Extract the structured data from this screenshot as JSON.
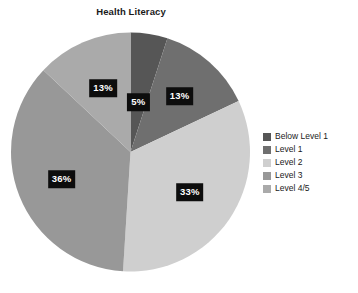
{
  "chart_data": {
    "type": "pie",
    "title": "Health Literacy",
    "xlabel": "",
    "ylabel": "",
    "categories": [
      "Below Level 1",
      "Level 1",
      "Level 2",
      "Level 3",
      "Level 4/5"
    ],
    "values": [
      5,
      13,
      33,
      36,
      13
    ],
    "value_labels": [
      "5%",
      "13%",
      "33%",
      "36%",
      "13%"
    ],
    "colors": [
      "#565656",
      "#6f6f6f",
      "#cfcfcf",
      "#989898",
      "#aaaaaa"
    ],
    "legend_position": "right",
    "grid": false,
    "start_angle_deg": 0,
    "direction": "clockwise",
    "label_style": "white-text-on-black-box"
  },
  "legend": {
    "items": [
      {
        "label": "Below Level 1",
        "color": "#565656"
      },
      {
        "label": "Level 1",
        "color": "#6f6f6f"
      },
      {
        "label": "Level 2",
        "color": "#cfcfcf"
      },
      {
        "label": "Level 3",
        "color": "#989898"
      },
      {
        "label": "Level 4/5",
        "color": "#aaaaaa"
      }
    ]
  }
}
